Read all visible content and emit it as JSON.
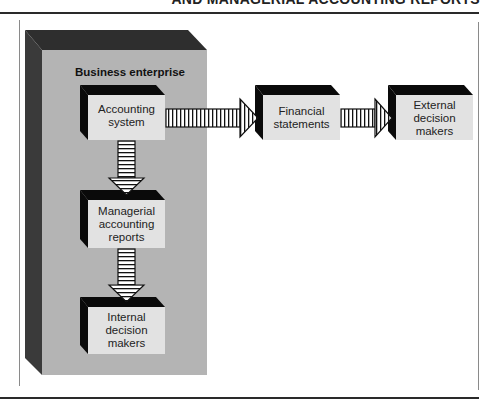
{
  "header": {
    "clipped_title": "AND MANAGERIAL ACCOUNTING REPORTS"
  },
  "diagram": {
    "container": {
      "label": "Business enterprise"
    },
    "nodes": [
      {
        "id": "accounting-system",
        "line1": "Accounting",
        "line2": "system",
        "line3": ""
      },
      {
        "id": "managerial-reports",
        "line1": "Managerial",
        "line2": "accounting",
        "line3": "reports"
      },
      {
        "id": "internal-decision-makers",
        "line1": "Internal",
        "line2": "decision",
        "line3": "makers"
      },
      {
        "id": "financial-statements",
        "line1": "Financial",
        "line2": "statements",
        "line3": ""
      },
      {
        "id": "external-decision-makers",
        "line1": "External",
        "line2": "decision",
        "line3": "makers"
      }
    ],
    "edges": [
      {
        "from": "accounting-system",
        "to": "financial-statements",
        "style": "striped-arrow-right"
      },
      {
        "from": "financial-statements",
        "to": "external-decision-makers",
        "style": "striped-arrow-right"
      },
      {
        "from": "accounting-system",
        "to": "managerial-reports",
        "style": "striped-arrow-down"
      },
      {
        "from": "managerial-reports",
        "to": "internal-decision-makers",
        "style": "striped-arrow-down"
      }
    ],
    "colors": {
      "container_face": "#b4b4b4",
      "container_side": "#2e2e2e",
      "box_face": "#e2e2e2",
      "box_side": "#0a0a0a",
      "arrow_fill": "#ffffff",
      "arrow_stroke": "#111111"
    }
  }
}
